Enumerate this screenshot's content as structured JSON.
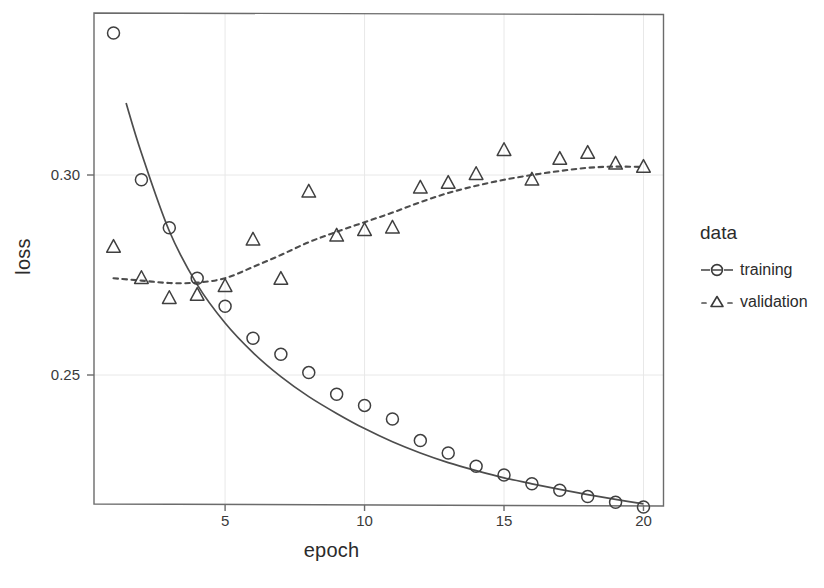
{
  "chart_data": {
    "type": "scatter",
    "title": "",
    "xlabel": "epoch",
    "ylabel": "loss",
    "xlim": [
      0.3,
      20.7
    ],
    "ylim": [
      0.2175,
      0.3405
    ],
    "xticks": [
      5,
      10,
      15,
      20
    ],
    "xtick_labels": [
      "5",
      "10",
      "15",
      "20"
    ],
    "yticks": [
      0.25,
      0.3
    ],
    "ytick_labels": [
      "0.25",
      "0.30"
    ],
    "grid": true,
    "legend": {
      "title": "data",
      "position": "right",
      "entries": [
        {
          "label": "training",
          "marker": "circle",
          "line": "solid"
        },
        {
          "label": "validation",
          "marker": "triangle",
          "line": "dotted"
        }
      ]
    },
    "x": [
      1,
      2,
      3,
      4,
      5,
      6,
      7,
      8,
      9,
      10,
      11,
      12,
      13,
      14,
      15,
      16,
      17,
      18,
      19,
      20
    ],
    "series": [
      {
        "name": "training",
        "marker": "circle",
        "line": "solid",
        "color": "#4d4d4d",
        "values": [
          0.3355,
          0.2988,
          0.2868,
          0.2742,
          0.2672,
          0.2592,
          0.2552,
          0.2506,
          0.2452,
          0.2424,
          0.239,
          0.2336,
          0.2305,
          0.2272,
          0.225,
          0.2228,
          0.2212,
          0.2196,
          0.2182,
          0.217
        ]
      },
      {
        "name": "validation",
        "marker": "triangle",
        "line": "dotted",
        "color": "#4d4d4d",
        "values": [
          0.282,
          0.2742,
          0.2692,
          0.27,
          0.2722,
          0.2838,
          0.274,
          0.2958,
          0.2848,
          0.2862,
          0.2868,
          0.2968,
          0.298,
          0.3002,
          0.3062,
          0.2988,
          0.304,
          0.3055,
          0.3028,
          0.302
        ]
      }
    ],
    "trend_lines": [
      {
        "name": "training-trend",
        "line": "solid",
        "x": [
          1.45,
          2,
          3,
          4,
          5,
          6,
          7,
          8,
          9,
          10,
          11,
          12,
          13,
          14,
          15,
          16,
          17,
          18,
          19,
          20
        ],
        "values": [
          0.318,
          0.3055,
          0.286,
          0.2726,
          0.263,
          0.2556,
          0.2496,
          0.2446,
          0.2404,
          0.2366,
          0.2333,
          0.2305,
          0.2281,
          0.2261,
          0.2243,
          0.2228,
          0.2214,
          0.2201,
          0.2189,
          0.2178
        ]
      },
      {
        "name": "validation-trend",
        "line": "dotted",
        "x": [
          1,
          2,
          3,
          4,
          5,
          6,
          7,
          8,
          9,
          10,
          11,
          12,
          13,
          14,
          15,
          16,
          17,
          18,
          19,
          20
        ],
        "values": [
          0.2742,
          0.2736,
          0.273,
          0.2731,
          0.2742,
          0.277,
          0.28,
          0.2832,
          0.2858,
          0.2882,
          0.2906,
          0.2932,
          0.2955,
          0.2973,
          0.2988,
          0.3,
          0.301,
          0.3018,
          0.3021,
          0.302
        ]
      }
    ]
  },
  "axes": {
    "xlabel": "epoch",
    "ylabel": "loss"
  },
  "legend": {
    "title": "data",
    "training_label": "training",
    "validation_label": "validation"
  },
  "colors": {
    "ink": "#4d4d4d",
    "grid": "#e8e8e8",
    "text": "#2b2b2b",
    "background": "#ffffff"
  }
}
